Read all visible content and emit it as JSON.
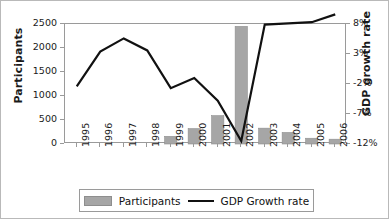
{
  "chart_data": {
    "type": "bar",
    "title": "",
    "subtitle": "",
    "xlabel": "",
    "ylabel": "Participants",
    "y2label": "GDP growth rate",
    "categories": [
      "1995",
      "1996",
      "1997",
      "1998",
      "1999",
      "2000",
      "2001",
      "2002",
      "2003",
      "2004",
      "2005",
      "2006"
    ],
    "grid": false,
    "legend_position": "bottom",
    "ylim": [
      0,
      2500
    ],
    "yticks": [
      0,
      500,
      1000,
      1500,
      2000,
      2500
    ],
    "ytick_labels": [
      "0",
      "500",
      "1000",
      "1500",
      "2000",
      "2500"
    ],
    "y2lim": [
      -12,
      8
    ],
    "y2ticks": [
      -12,
      -7,
      -2,
      3,
      8
    ],
    "y2tick_labels": [
      "-12%",
      "-7%",
      "-2%",
      "3%",
      "8%"
    ],
    "series": [
      {
        "name": "Participants",
        "type": "bar",
        "axis": "left",
        "color": "#a6a6a6",
        "values": [
          0,
          0,
          0,
          0,
          160,
          320,
          590,
          2450,
          330,
          240,
          120,
          100
        ]
      },
      {
        "name": "GDP Growth rate",
        "type": "line",
        "axis": "right",
        "color": "#111111",
        "values": [
          -2.4,
          3.4,
          5.6,
          3.6,
          -2.7,
          -1.0,
          -4.8,
          -11.5,
          7.9,
          8.1,
          8.3,
          9.6
        ]
      }
    ]
  },
  "axes": {
    "left_title": "Participants",
    "right_title": "GDP growth rate"
  },
  "legend": {
    "items": [
      {
        "label": "Participants",
        "marker": "bar-swatch",
        "color": "#a6a6a6"
      },
      {
        "label": "GDP Growth rate",
        "marker": "line-swatch",
        "color": "#111111"
      }
    ]
  }
}
